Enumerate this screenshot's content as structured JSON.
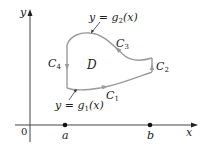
{
  "axes": {
    "x_label": "x",
    "y_label": "y",
    "origin_label": "0",
    "point_a_label": "a",
    "point_b_label": "b"
  },
  "region": {
    "label": "D"
  },
  "curves": {
    "c1": {
      "name": "C",
      "sub": "1"
    },
    "c2": {
      "name": "C",
      "sub": "2"
    },
    "c3": {
      "name": "C",
      "sub": "3"
    },
    "c4": {
      "name": "C",
      "sub": "4"
    }
  },
  "functions": {
    "upper": {
      "prefix": "y = g",
      "sub": "2",
      "suffix": "(x)"
    },
    "lower": {
      "prefix": "y = g",
      "sub": "1",
      "suffix": "(x)"
    }
  },
  "colors": {
    "curve": "#9a9a9a",
    "axis": "#444444",
    "text": "#222222"
  }
}
